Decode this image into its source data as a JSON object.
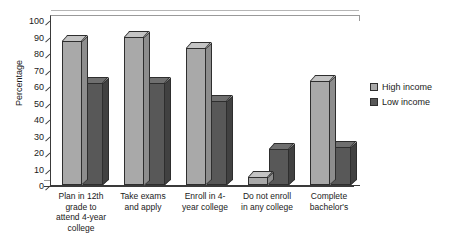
{
  "chart_data": {
    "type": "bar",
    "title": "",
    "xlabel": "",
    "ylabel": "Percentage",
    "ylim": [
      0,
      100
    ],
    "ytick_step": 10,
    "yticks": [
      0,
      10,
      20,
      30,
      40,
      50,
      60,
      70,
      80,
      90,
      100
    ],
    "grid": true,
    "legend_position": "right",
    "categories": [
      "Plan in 12th grade to attend 4-year college",
      "Take exams and apply",
      "Enroll in 4-year college",
      "Do not enroll in any college",
      "Complete bachelor's"
    ],
    "category_lines": [
      [
        "Plan in 12th",
        "grade to",
        "attend 4-year",
        "college"
      ],
      [
        "Take exams",
        "and apply"
      ],
      [
        "Enroll in 4-",
        "year college"
      ],
      [
        "Do not enroll",
        "in any college"
      ],
      [
        "Complete",
        "bachelor's"
      ]
    ],
    "series": [
      {
        "name": "High income",
        "color": "#a9a9a9",
        "values": [
          87,
          90,
          83,
          5,
          63
        ]
      },
      {
        "name": "Low income",
        "color": "#585858",
        "values": [
          62,
          62,
          51,
          22,
          23
        ]
      }
    ]
  },
  "legend": {
    "items": [
      {
        "label": "High income",
        "swatch": "high"
      },
      {
        "label": "Low income",
        "swatch": "low"
      }
    ]
  }
}
